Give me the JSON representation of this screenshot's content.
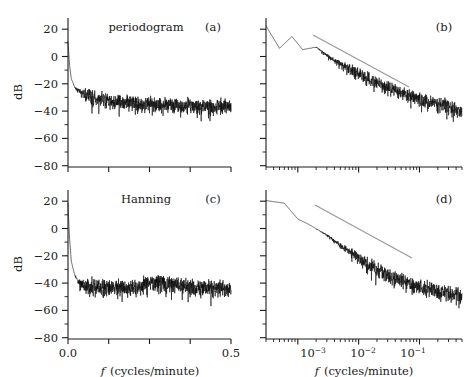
{
  "figure": {
    "y_axis_label": "dB",
    "x_axis_label_italic": "f",
    "x_axis_label_rest": "(cycles/minute)"
  },
  "panels": [
    {
      "id": "a",
      "label": "(a)",
      "title": "periodogram",
      "xscale": "linear",
      "xticklabels": [
        "",
        "",
        "",
        "",
        ""
      ],
      "yticklabels": [
        "20",
        "0",
        "−20",
        "−40",
        "−60",
        "−80"
      ]
    },
    {
      "id": "b",
      "label": "(b)",
      "title": "",
      "xscale": "log",
      "xticklabels": [
        "",
        "",
        ""
      ],
      "yticklabels": [
        "",
        "",
        "",
        "",
        "",
        ""
      ]
    },
    {
      "id": "c",
      "label": "(c)",
      "title": "Hanning",
      "xscale": "linear",
      "xticklabels": [
        "0.0",
        "0.5"
      ],
      "yticklabels": [
        "20",
        "0",
        "−20",
        "−40",
        "−60",
        "−80"
      ]
    },
    {
      "id": "d",
      "label": "(d)",
      "title": "",
      "xscale": "log",
      "xticklabels": [
        "10",
        "10",
        "10"
      ],
      "xtickexponents": [
        "−3",
        "−2",
        "−1"
      ],
      "yticklabels": [
        "",
        "",
        "",
        "",
        "",
        ""
      ]
    }
  ],
  "chart_data": {
    "type": "line",
    "title": "",
    "panel_count": 4,
    "shared": {
      "ylabel": "dB",
      "xlabel": "f (cycles/minute)",
      "ylim": [
        -85,
        28
      ],
      "yticks": [
        20,
        0,
        -20,
        -40,
        -60,
        -80
      ]
    },
    "panels": [
      {
        "id": "a",
        "title": "periodogram",
        "xlabel": "f (cycles/minute)",
        "ylabel": "dB",
        "xscale": "linear",
        "xlim": [
          0.0,
          0.5
        ],
        "xticks": [
          0.0,
          0.125,
          0.25,
          0.375,
          0.5
        ],
        "xticklabels": [
          "0.0",
          "",
          "",
          "",
          "0.5"
        ],
        "ylim": [
          -85,
          28
        ],
        "yticks": [
          20,
          0,
          -20,
          -40,
          -60,
          -80
        ],
        "grid": false,
        "legend": "none",
        "series": [
          {
            "name": "periodogram spectral estimate",
            "color": "#0d0d0d",
            "description": "Raw periodogram of series; sharp peak near f=0 at about +10 dB falling steeply to roughly -25 dB by f=0.02, then a slow decay flattening to a noisy plateau around -38 dB with scatter of about +-12 dB out to f=0.5.",
            "envelope_mean": [
              {
                "f": 0.0,
                "dB": 10
              },
              {
                "f": 0.005,
                "dB": -8
              },
              {
                "f": 0.01,
                "dB": -18
              },
              {
                "f": 0.02,
                "dB": -24
              },
              {
                "f": 0.04,
                "dB": -28
              },
              {
                "f": 0.07,
                "dB": -31
              },
              {
                "f": 0.1,
                "dB": -33
              },
              {
                "f": 0.15,
                "dB": -35
              },
              {
                "f": 0.2,
                "dB": -36
              },
              {
                "f": 0.3,
                "dB": -37
              },
              {
                "f": 0.4,
                "dB": -38
              },
              {
                "f": 0.5,
                "dB": -38
              }
            ],
            "scatter_dB": 12
          }
        ]
      },
      {
        "id": "b",
        "title": "",
        "xlabel": "f (cycles/minute)",
        "ylabel": "dB",
        "xscale": "log",
        "xlim": [
          0.0003,
          0.5
        ],
        "xticks": [
          0.001,
          0.01,
          0.1
        ],
        "xticklabels": [
          "10^-3",
          "10^-2",
          "10^-1"
        ],
        "ylim": [
          -85,
          28
        ],
        "yticks": [
          20,
          0,
          -20,
          -40,
          -60,
          -80
        ],
        "grid": false,
        "legend": "none",
        "series": [
          {
            "name": "periodogram spectral estimate (log frequency)",
            "color": "#0d0d0d",
            "description": "Same periodogram on log-frequency axis; begins near +22 dB at lowest frequency with large oscillations, declines approximately linearly in log-f to about -45 dB near f=0.5 with increasing scatter.",
            "envelope_mean": [
              {
                "f": 0.0003,
                "dB": 22
              },
              {
                "f": 0.0005,
                "dB": 5
              },
              {
                "f": 0.0008,
                "dB": 14
              },
              {
                "f": 0.0012,
                "dB": 4
              },
              {
                "f": 0.002,
                "dB": 6
              },
              {
                "f": 0.004,
                "dB": -4
              },
              {
                "f": 0.008,
                "dB": -11
              },
              {
                "f": 0.02,
                "dB": -20
              },
              {
                "f": 0.05,
                "dB": -28
              },
              {
                "f": 0.1,
                "dB": -33
              },
              {
                "f": 0.3,
                "dB": -38
              },
              {
                "f": 0.5,
                "dB": -42
              }
            ],
            "scatter_dB": 10
          },
          {
            "name": "reference slope line",
            "color": "#9a9a9a",
            "type": "annotation-line",
            "from": {
              "f": 0.0012,
              "dB": 12
            },
            "to": {
              "f": 0.12,
              "dB": -22
            }
          }
        ]
      },
      {
        "id": "c",
        "title": "Hanning",
        "xlabel": "f (cycles/minute)",
        "ylabel": "dB",
        "xscale": "linear",
        "xlim": [
          0.0,
          0.5
        ],
        "xticks": [
          0.0,
          0.125,
          0.25,
          0.375,
          0.5
        ],
        "xticklabels": [
          "0.0",
          "",
          "",
          "",
          "0.5"
        ],
        "ylim": [
          -85,
          28
        ],
        "yticks": [
          20,
          0,
          -20,
          -40,
          -60,
          -80
        ],
        "grid": false,
        "legend": "none",
        "series": [
          {
            "name": "Hanning-tapered spectral estimate",
            "color": "#0d0d0d",
            "description": "Hanning-tapered periodogram; peak near +18 dB at f=0 dropping very steeply to about -40 dB by f=0.03, then an essentially flat noisy floor near -45 dB with scatter of roughly +-18 dB, including a modest local rise near f=0.27.",
            "envelope_mean": [
              {
                "f": 0.0,
                "dB": 18
              },
              {
                "f": 0.004,
                "dB": -6
              },
              {
                "f": 0.01,
                "dB": -26
              },
              {
                "f": 0.02,
                "dB": -36
              },
              {
                "f": 0.03,
                "dB": -41
              },
              {
                "f": 0.06,
                "dB": -45
              },
              {
                "f": 0.1,
                "dB": -45
              },
              {
                "f": 0.18,
                "dB": -46
              },
              {
                "f": 0.27,
                "dB": -41
              },
              {
                "f": 0.35,
                "dB": -45
              },
              {
                "f": 0.45,
                "dB": -46
              },
              {
                "f": 0.5,
                "dB": -46
              }
            ],
            "scatter_dB": 16
          }
        ]
      },
      {
        "id": "d",
        "title": "",
        "xlabel": "f (cycles/minute)",
        "ylabel": "dB",
        "xscale": "log",
        "xlim": [
          0.0003,
          0.5
        ],
        "xticks": [
          0.001,
          0.01,
          0.1
        ],
        "xticklabels": [
          "10^-3",
          "10^-2",
          "10^-1"
        ],
        "ylim": [
          -85,
          28
        ],
        "yticks": [
          20,
          0,
          -20,
          -40,
          -60,
          -80
        ],
        "grid": false,
        "legend": "none",
        "series": [
          {
            "name": "Hanning-tapered spectral estimate (log frequency)",
            "color": "#0d0d0d",
            "description": "Hanning estimate on log-frequency axis; flat near +20 dB at the lowest frequencies, rolls off smoothly and then decays roughly linearly in log-f to about -55 dB near f=0.5 with growing scatter.",
            "envelope_mean": [
              {
                "f": 0.0003,
                "dB": 20
              },
              {
                "f": 0.0006,
                "dB": 18
              },
              {
                "f": 0.001,
                "dB": 6
              },
              {
                "f": 0.0015,
                "dB": 2
              },
              {
                "f": 0.003,
                "dB": -6
              },
              {
                "f": 0.006,
                "dB": -16
              },
              {
                "f": 0.012,
                "dB": -26
              },
              {
                "f": 0.03,
                "dB": -36
              },
              {
                "f": 0.07,
                "dB": -43
              },
              {
                "f": 0.15,
                "dB": -47
              },
              {
                "f": 0.3,
                "dB": -50
              },
              {
                "f": 0.5,
                "dB": -52
              }
            ],
            "scatter_dB": 14
          },
          {
            "name": "reference slope line",
            "color": "#9a9a9a",
            "type": "annotation-line",
            "from": {
              "f": 0.0013,
              "dB": 14
            },
            "to": {
              "f": 0.13,
              "dB": -22
            }
          }
        ]
      }
    ]
  }
}
